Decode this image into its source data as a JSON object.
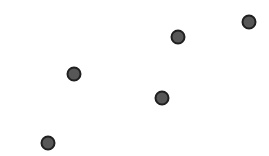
{
  "chart_data": {
    "type": "scatter",
    "title": "",
    "xlabel": "",
    "ylabel": "",
    "grid": false,
    "points": [
      {
        "x": 74,
        "y": 74
      },
      {
        "x": 178,
        "y": 37
      },
      {
        "x": 249,
        "y": 22
      },
      {
        "x": 162,
        "y": 98
      },
      {
        "x": 48,
        "y": 143
      }
    ],
    "marker": {
      "radius": 6.5,
      "fill": "#575757",
      "stroke": "#1f1f1f",
      "stroke_width": 2
    }
  }
}
